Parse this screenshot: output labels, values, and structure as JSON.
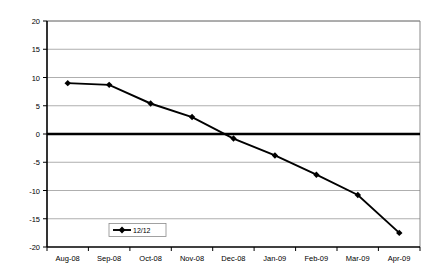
{
  "chart_data": {
    "type": "line",
    "title": "",
    "subtitle": "",
    "xlabel": "",
    "ylabel": "",
    "categories": [
      "Aug-08",
      "Sep-08",
      "Oct-08",
      "Nov-08",
      "Dec-08",
      "Jan-09",
      "Feb-09",
      "Mar-09",
      "Apr-09"
    ],
    "series": [
      {
        "name": "12/12",
        "values": [
          9.0,
          8.7,
          5.4,
          3.0,
          -0.8,
          -3.8,
          -7.2,
          -10.8,
          -17.5
        ],
        "color": "#000000",
        "marker": "diamond"
      }
    ],
    "ylim": [
      -20,
      20
    ],
    "ytick_labels": [
      "20",
      "15",
      "10",
      "5",
      "0",
      "-5",
      "-10",
      "-15",
      "-20"
    ],
    "ytick_values": [
      20,
      15,
      10,
      5,
      0,
      -5,
      -10,
      -15,
      -20
    ],
    "grid": true,
    "grid_axis": "y",
    "legend_position": "inside-bottom-left",
    "reference_lines": [
      {
        "name": "zero-line",
        "value": 0,
        "color": "#000000",
        "width": "thick"
      }
    ],
    "plot_background": "#ffffff",
    "grid_color": "#9a9a9a",
    "axis_color": "#000000"
  },
  "legend": {
    "entries": [
      {
        "label": "12/12",
        "marker": "line-diamond-marker"
      }
    ]
  }
}
